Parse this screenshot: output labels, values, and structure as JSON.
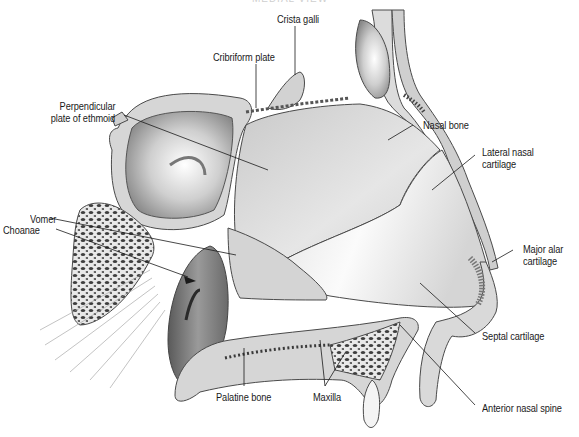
{
  "figure": {
    "title_cropped": "MEDIAL VIEW",
    "colors": {
      "bone_fill": "#d9d9d9",
      "bone_edge": "#4a4a4a",
      "cavity_dark": "#7a7a7a",
      "cartilage_fill": "#f2f2f2",
      "cancellous_dots": "#3a3a3a",
      "leader_line": "#1a1a1a",
      "label_text": "#1a1a1a",
      "background": "#ffffff"
    }
  },
  "labels": {
    "crista_galli": "Crista galli",
    "cribriform_plate": "Cribriform plate",
    "perpendicular_plate_line1": "Perpendicular",
    "perpendicular_plate_line2": "plate of ethmoid",
    "nasal_bone": "Nasal bone",
    "lateral_nasal_cartilage_line1": "Lateral nasal",
    "lateral_nasal_cartilage_line2": "cartilage",
    "vomer": "Vomer",
    "choanae": "Choanae",
    "major_alar_cartilage_line1": "Major alar",
    "major_alar_cartilage_line2": "cartilage",
    "septal_cartilage": "Septal cartilage",
    "palatine_bone": "Palatine bone",
    "maxilla": "Maxilla",
    "anterior_nasal_spine": "Anterior nasal spine"
  }
}
